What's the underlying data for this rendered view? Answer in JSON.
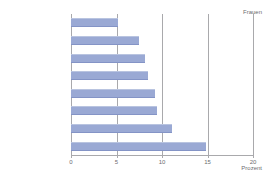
{
  "chart_data": {
    "type": "bar",
    "orientation": "horizontal",
    "title": "",
    "subtitle": "",
    "xlabel": "Prozent",
    "ylabel": "",
    "xlim": [
      0,
      20
    ],
    "xticks": [
      "0",
      "5",
      "10",
      "15",
      "20"
    ],
    "grid": "vertical",
    "legend_position": "top-right",
    "annotations": [
      "Frauen"
    ],
    "series_label": "Frauen",
    "bar_color": "#9aa9d4",
    "grid_color": "#a9a9ac",
    "text_color": "#58585a",
    "background": "#ffffff",
    "categories": [
      "Backwaren",
      "Fleisch, Wurst",
      "Fette",
      "Alkoholfr. Getränke",
      "Obst",
      "Süßwaren",
      "Milch, Käse",
      "Brot"
    ],
    "values": [
      5.2,
      7.5,
      8.1,
      8.5,
      9.2,
      9.4,
      11.1,
      14.8
    ]
  }
}
